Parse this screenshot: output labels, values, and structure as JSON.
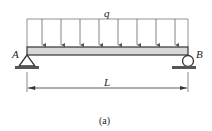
{
  "diagram": {
    "load_label": "q",
    "support_left_label": "A",
    "support_right_label": "B",
    "span_label": "L",
    "caption": "(a)",
    "load_arrow_count": 8,
    "colors": {
      "line": "#333333",
      "beam_fill": "#d8d8d8",
      "background": "#ffffff"
    }
  }
}
